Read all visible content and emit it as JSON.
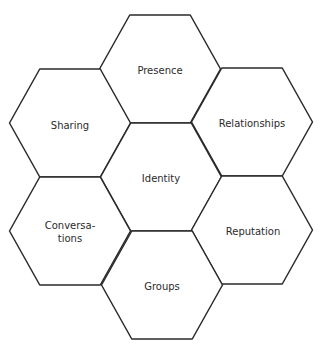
{
  "diagram": {
    "title": "",
    "hexagons": [
      {
        "id": "presence",
        "label": "Presence",
        "cx": 160,
        "cy": 69
      },
      {
        "id": "sharing",
        "label": "Sharing",
        "cx": 70,
        "cy": 123
      },
      {
        "id": "relationships",
        "label": "Relationships",
        "cx": 252,
        "cy": 122
      },
      {
        "id": "identity",
        "label": "Identity",
        "cx": 161,
        "cy": 177
      },
      {
        "id": "conversations",
        "label": "Conversa-\ntions",
        "cx": 70,
        "cy": 231
      },
      {
        "id": "reputation",
        "label": "Reputation",
        "cx": 252,
        "cy": 230
      },
      {
        "id": "groups",
        "label": "Groups",
        "cx": 162,
        "cy": 285
      }
    ],
    "hex_width": 121,
    "hex_height": 108,
    "stroke_color": "#2a2a2a",
    "text_color": "#2b2b2b",
    "background": "#ffffff"
  }
}
